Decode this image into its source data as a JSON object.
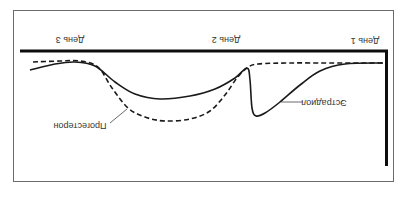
{
  "chart_data": {
    "type": "line",
    "orientation_note": "figure rendered rotated 180 degrees",
    "title": "",
    "xlabel": "",
    "ylabel": "",
    "x_ticks": [
      "День 1",
      "День 2",
      "День 3"
    ],
    "grid": false,
    "legend": "inline annotations",
    "series": [
      {
        "name": "Эстрадиол",
        "style": "solid",
        "points_screen": [
          [
            30,
            70
          ],
          [
            55,
            64
          ],
          [
            75,
            62
          ],
          [
            95,
            66
          ],
          [
            115,
            82
          ],
          [
            135,
            94
          ],
          [
            160,
            99
          ],
          [
            190,
            96
          ],
          [
            215,
            89
          ],
          [
            235,
            78
          ],
          [
            247,
            68
          ],
          [
            250,
            80
          ],
          [
            252,
            108
          ],
          [
            256,
            116
          ],
          [
            265,
            113
          ],
          [
            280,
            102
          ],
          [
            300,
            85
          ],
          [
            320,
            71
          ],
          [
            345,
            64
          ],
          [
            383,
            63
          ]
        ]
      },
      {
        "name": "Прогестерон",
        "style": "dashed",
        "points_screen": [
          [
            33,
            62
          ],
          [
            60,
            61
          ],
          [
            80,
            61
          ],
          [
            98,
            67
          ],
          [
            112,
            88
          ],
          [
            128,
            108
          ],
          [
            145,
            117
          ],
          [
            165,
            121
          ],
          [
            190,
            119
          ],
          [
            210,
            111
          ],
          [
            225,
            95
          ],
          [
            237,
            78
          ],
          [
            247,
            68
          ],
          [
            258,
            64
          ],
          [
            290,
            63
          ],
          [
            330,
            63
          ],
          [
            383,
            63
          ]
        ]
      }
    ]
  },
  "labels": {
    "day1": "День 1",
    "day2": "День 2",
    "day3": "День 3",
    "progesterone": "Прогестерон",
    "estradiol": "Эстрадиол"
  },
  "colors": {
    "line": "#1a1a1a",
    "axis": "#0d0d0d",
    "frame": "#6b6b6b",
    "text": "#333333"
  }
}
